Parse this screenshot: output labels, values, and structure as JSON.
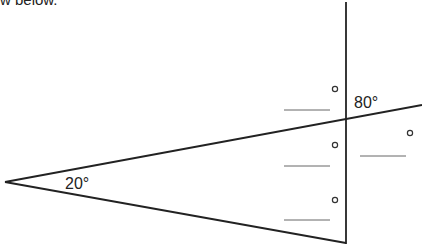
{
  "caption": "w below.",
  "diagram": {
    "type": "geometry-angles",
    "given_angles": [
      {
        "id": "apex",
        "label": "20°",
        "position": "left apex"
      },
      {
        "id": "upper-right",
        "label": "80°",
        "position": "upper right of intersection"
      }
    ],
    "blank_angles": [
      {
        "id": "upper-left",
        "label": "°",
        "position": "upper left of intersection"
      },
      {
        "id": "lower-right",
        "label": "°",
        "position": "lower right of intersection"
      },
      {
        "id": "lower-left",
        "label": "°",
        "position": "lower left of intersection"
      },
      {
        "id": "bottom",
        "label": "°",
        "position": "bottom vertex"
      }
    ],
    "line_color": "#222222",
    "blank_color": "#666666"
  }
}
